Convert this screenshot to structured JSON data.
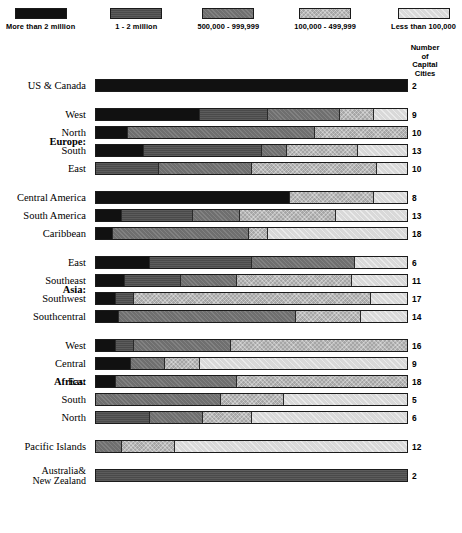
{
  "legend": {
    "items": [
      {
        "label": "More than 2 million",
        "key": "gt2m",
        "color": "#111111"
      },
      {
        "label": "1 - 2 million",
        "key": "1to2m",
        "color": "#4a4a4a"
      },
      {
        "label": "500,000 - 999,999",
        "key": "500k",
        "color": "#6f6f6f"
      },
      {
        "label": "100,000 - 499,999",
        "key": "100k",
        "color": "#a6a6a6"
      },
      {
        "label": "Less than 100,000",
        "key": "lt100k",
        "color": "#d9d9d9"
      }
    ]
  },
  "count_header": {
    "line1": "Number",
    "line2": "of",
    "line3": "Capital",
    "line4": "Cities"
  },
  "chart_data": {
    "type": "bar",
    "subtype": "100% stacked horizontal bar",
    "xlabel": "",
    "ylabel": "",
    "xlim": [
      0,
      100
    ],
    "grid": false,
    "legend_position": "top",
    "series": [
      {
        "name": "More than 2 million",
        "key": "gt2m"
      },
      {
        "name": "1 - 2 million",
        "key": "1to2m"
      },
      {
        "name": "500,000 - 999,999",
        "key": "500k"
      },
      {
        "name": "100,000 - 499,999",
        "key": "100k"
      },
      {
        "name": "Less than 100,000",
        "key": "lt100k"
      }
    ],
    "value_column_header": "Number of Capital Cities",
    "groups": [
      {
        "group_label": "",
        "rows": [
          {
            "label": "US & Canada",
            "count": "2",
            "values": [
              100,
              0,
              0,
              0,
              0
            ]
          }
        ]
      },
      {
        "group_label": "Europe:",
        "rows": [
          {
            "label": "West",
            "count": "9",
            "values": [
              33,
              22,
              23,
              11,
              11
            ]
          },
          {
            "label": "North",
            "count": "10",
            "values": [
              10,
              0,
              60,
              30,
              0
            ]
          },
          {
            "label": "South",
            "count": "13",
            "values": [
              15,
              38,
              8,
              23,
              16
            ]
          },
          {
            "label": "East",
            "count": "10",
            "values": [
              0,
              20,
              30,
              40,
              10
            ]
          }
        ]
      },
      {
        "group_label": "",
        "rows": [
          {
            "label": "Central America",
            "count": "8",
            "values": [
              62,
              0,
              0,
              27,
              11
            ]
          },
          {
            "label": "South America",
            "count": "13",
            "values": [
              8,
              23,
              15,
              31,
              23
            ]
          },
          {
            "label": "Caribbean",
            "count": "18",
            "values": [
              5,
              0,
              44,
              6,
              45
            ]
          }
        ]
      },
      {
        "group_label": "Asia:",
        "rows": [
          {
            "label": "East",
            "count": "6",
            "values": [
              17,
              33,
              33,
              0,
              17
            ]
          },
          {
            "label": "Southeast",
            "count": "11",
            "values": [
              9,
              18,
              18,
              37,
              18
            ]
          },
          {
            "label": "Southwest",
            "count": "17",
            "values": [
              6,
              6,
              0,
              76,
              12
            ]
          },
          {
            "label": "Southcentral",
            "count": "14",
            "values": [
              7,
              0,
              57,
              21,
              15
            ]
          }
        ]
      },
      {
        "group_label": "Africa:",
        "rows": [
          {
            "label": "West",
            "count": "16",
            "values": [
              6,
              6,
              31,
              57,
              0
            ]
          },
          {
            "label": "Central",
            "count": "9",
            "values": [
              11,
              0,
              11,
              11,
              67
            ]
          },
          {
            "label": "East",
            "count": "18",
            "values": [
              6,
              0,
              39,
              55,
              0
            ]
          },
          {
            "label": "South",
            "count": "5",
            "values": [
              0,
              0,
              40,
              20,
              40
            ]
          },
          {
            "label": "North",
            "count": "6",
            "values": [
              0,
              17,
              17,
              16,
              50
            ]
          }
        ]
      },
      {
        "group_label": "",
        "rows": [
          {
            "label": "Pacific Islands",
            "count": "12",
            "values": [
              0,
              0,
              8,
              17,
              75
            ]
          }
        ]
      },
      {
        "group_label": "",
        "rows": [
          {
            "label": "Australia&\nNew Zealand",
            "count": "2",
            "values": [
              0,
              100,
              0,
              0,
              0
            ]
          }
        ]
      }
    ]
  }
}
